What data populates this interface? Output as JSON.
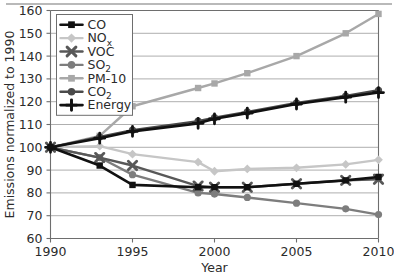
{
  "chart_data": {
    "type": "line",
    "title": "",
    "xlabel": "Year",
    "ylabel": "Emissions normalized to 1990",
    "xlim": [
      1990,
      2010
    ],
    "ylim": [
      60,
      160
    ],
    "ytick_values": [
      60,
      70,
      80,
      90,
      100,
      110,
      120,
      130,
      140,
      150,
      160
    ],
    "ytick_labels": [
      "60",
      "70",
      "80",
      "90",
      "100",
      "110",
      "120",
      "130",
      "140",
      "150",
      "160"
    ],
    "xtick_values": [
      1990,
      1995,
      2000,
      2005,
      2010
    ],
    "xtick_labels": [
      "1990",
      "1995",
      "2000",
      "2005",
      "2010"
    ],
    "grid": "horizontal",
    "legend_position": "top-left-inside",
    "x": [
      1990,
      1993,
      1995,
      1999,
      2000,
      2002,
      2005,
      2008,
      2010
    ],
    "series": [
      {
        "name": "CO",
        "label_main": "CO",
        "label_sub": "",
        "color": "#111111",
        "marker": "square",
        "line_width": 2.6,
        "values": [
          100,
          92,
          83.5,
          82.5,
          82.5,
          82.5,
          84,
          85.5,
          87
        ]
      },
      {
        "name": "NOx",
        "label_main": "NO",
        "label_sub": "x",
        "color": "#c6c6c6",
        "marker": "diamond",
        "line_width": 2.4,
        "values": [
          100,
          100.5,
          97,
          93.5,
          89.5,
          90.5,
          91,
          92.5,
          94.5
        ]
      },
      {
        "name": "VOC",
        "label_main": "VOC",
        "label_sub": "",
        "color": "#585858",
        "marker": "x",
        "line_width": 2.4,
        "values": [
          100,
          95.5,
          92,
          83,
          82.5,
          82.5,
          84,
          85.5,
          86
        ]
      },
      {
        "name": "SO2",
        "label_main": "SO",
        "label_sub": "2",
        "color": "#7d7d7d",
        "marker": "circle",
        "line_width": 2.4,
        "values": [
          100,
          95.5,
          88,
          80,
          79.5,
          78,
          75.5,
          73,
          70.5
        ]
      },
      {
        "name": "PM-10",
        "label_main": "PM-10",
        "label_sub": "",
        "color": "#a8a8a8",
        "marker": "square",
        "line_width": 2.4,
        "values": [
          100,
          105,
          118,
          126,
          128,
          132.5,
          140,
          150,
          158.5
        ]
      },
      {
        "name": "CO2",
        "label_main": "CO",
        "label_sub": "2",
        "color": "#4a4a4a",
        "marker": "circle",
        "line_width": 2.4,
        "values": [
          100,
          104.5,
          107.5,
          111.5,
          113,
          115.5,
          119.5,
          122.5,
          125
        ]
      },
      {
        "name": "Energy",
        "label_main": "Energy",
        "label_sub": "",
        "color": "#111111",
        "marker": "plus",
        "line_width": 2.6,
        "values": [
          100,
          104,
          107,
          110.5,
          112.5,
          115,
          119,
          122,
          124
        ]
      }
    ]
  }
}
